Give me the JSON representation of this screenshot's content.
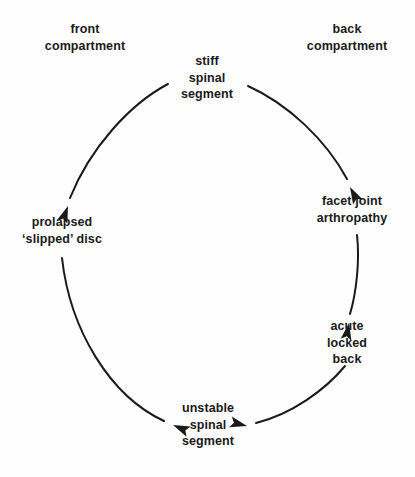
{
  "diagram": {
    "type": "cycle-flowchart",
    "background_color": "#fefefe",
    "text_color": "#1a1a1a",
    "line_color": "#1a1a1a",
    "headers": [
      {
        "id": "front-compartment",
        "label": "front\ncompartment",
        "x": 85,
        "y": 38
      },
      {
        "id": "back-compartment",
        "label": "back\ncompartment",
        "x": 347,
        "y": 38
      }
    ],
    "nodes": [
      {
        "id": "stiff-spinal-segment",
        "label": "stiff\nspinal\nsegment",
        "x": 207,
        "y": 78
      },
      {
        "id": "facet-joint-arthropathy",
        "label": "facet joint\narthropathy",
        "x": 352,
        "y": 210
      },
      {
        "id": "acute-locked-back",
        "label": "acute\nlocked back",
        "x": 347,
        "y": 343
      },
      {
        "id": "unstable-spinal-segment",
        "label": "unstable\nspinal\nsegment",
        "x": 208,
        "y": 425
      },
      {
        "id": "prolapsed-slipped-disc",
        "label": "prolapsed\n‘slipped’ disc",
        "x": 62,
        "y": 231
      }
    ],
    "edges": [
      {
        "id": "edge-stiff-to-prolapsed",
        "from": "stiff-spinal-segment",
        "to": "prolapsed-slipped-disc",
        "path": "M 168 84 C 130 104 90 148 70 196",
        "arrow_at": [
          68,
          205
        ],
        "arrow_angle": 113
      },
      {
        "id": "edge-stiff-to-facet",
        "from": "stiff-spinal-segment",
        "to": "facet-joint-arthropathy",
        "path": "M 248 86 C 288 104 326 140 346 176",
        "arrow_at": [
          350,
          186
        ],
        "arrow_angle": 62
      },
      {
        "id": "edge-facet-to-acute",
        "from": "facet-joint-arthropathy",
        "to": "acute-locked-back",
        "path": "M 357 235 C 360 262 356 294 350 312",
        "arrow_at": [
          348,
          322
        ],
        "arrow_angle": 100
      },
      {
        "id": "edge-acute-to-unstable",
        "from": "acute-locked-back",
        "to": "unstable-spinal-segment",
        "path": "M 345 366 C 325 390 292 414 258 423",
        "arrow_at": [
          248,
          426
        ],
        "arrow_angle": 194
      },
      {
        "id": "edge-prolapsed-to-unstable",
        "from": "prolapsed-slipped-disc",
        "to": "unstable-spinal-segment",
        "path": "M 62 258 C 70 330 110 396 162 420",
        "arrow_at": [
          172,
          425
        ],
        "arrow_angle": 23
      }
    ]
  }
}
